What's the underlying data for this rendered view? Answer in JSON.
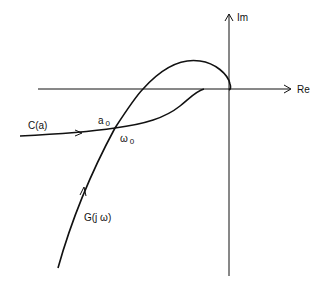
{
  "diagram": {
    "type": "nyquist-describing-function-plot",
    "axes": {
      "real_label": "Re",
      "imag_label": "Im"
    },
    "curves": [
      {
        "name": "G(jω)",
        "label": "G(j ω)",
        "description": "Frequency response locus rising from lower left, crossing negative real axis, looping above and returning to origin"
      },
      {
        "name": "C(a)",
        "label": "C(a)",
        "description": "Describing function locus entering from the left, curving up to meet the negative real axis"
      }
    ],
    "intersection": {
      "amplitude_label": "a",
      "amplitude_sub": "0",
      "frequency_label": "ω",
      "frequency_sub": "0"
    },
    "colors": {
      "stroke": "#111111",
      "background": "#ffffff"
    }
  }
}
